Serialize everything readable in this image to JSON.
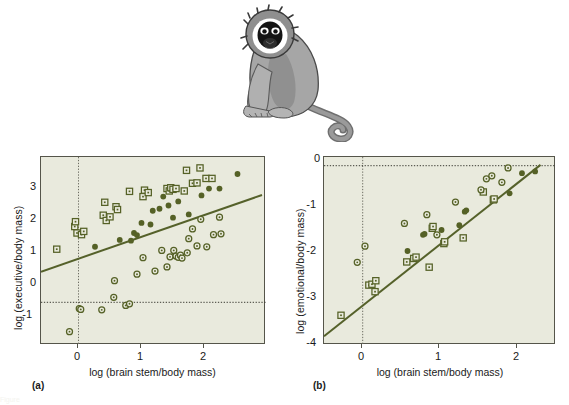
{
  "figure": {
    "illustration": "vervet-monkey-sitting",
    "caption_partial": "Figure"
  },
  "panels": [
    {
      "key": "(a)",
      "xlabel": "log (brain stem/body mass)",
      "ylabel": "log (executive/body mass)",
      "chart_data": {
        "type": "scatter",
        "title": "",
        "xlabel": "log (brain stem/body mass)",
        "ylabel": "log (executive/body mass)",
        "xlim": [
          -0.5,
          2.5
        ],
        "ylim": [
          -1.15,
          3.5
        ],
        "xticks": [
          0,
          1,
          2
        ],
        "yticks": [
          -1,
          0,
          1,
          2,
          3
        ],
        "grid": false,
        "reference_lines": [
          {
            "orientation": "vertical",
            "value": 0,
            "style": "dotted"
          },
          {
            "orientation": "horizontal",
            "value": 0,
            "style": "dotted"
          }
        ],
        "fit_line": {
          "x": [
            -0.5,
            2.45
          ],
          "y": [
            0.68,
            2.58
          ],
          "style": "solid"
        },
        "legend_position": "none",
        "series": [
          {
            "name": "open-square",
            "marker": "open-square",
            "points": [
              [
                -0.29,
                1.22
              ],
              [
                -0.05,
                1.78
              ],
              [
                -0.04,
                1.9
              ],
              [
                -0.02,
                1.62
              ],
              [
                0.04,
                1.58
              ],
              [
                0.07,
                1.66
              ],
              [
                0.33,
                2.06
              ],
              [
                0.35,
                2.38
              ],
              [
                0.37,
                1.93
              ],
              [
                0.42,
                2.02
              ],
              [
                0.5,
                2.27
              ],
              [
                0.52,
                2.2
              ],
              [
                0.68,
                2.65
              ],
              [
                0.86,
                2.52
              ],
              [
                0.88,
                2.68
              ],
              [
                0.93,
                2.62
              ],
              [
                1.18,
                2.72
              ],
              [
                1.21,
                2.66
              ],
              [
                1.23,
                2.74
              ],
              [
                1.26,
                2.7
              ],
              [
                1.3,
                2.72
              ],
              [
                1.41,
                2.66
              ],
              [
                1.44,
                3.17
              ],
              [
                1.52,
                2.85
              ],
              [
                1.58,
                2.86
              ],
              [
                1.62,
                3.23
              ],
              [
                1.7,
                2.97
              ],
              [
                1.78,
                2.97
              ]
            ]
          },
          {
            "name": "filled-circle",
            "marker": "filled-circle",
            "points": [
              [
                0.22,
                1.28
              ],
              [
                0.55,
                1.45
              ],
              [
                0.7,
                1.43
              ],
              [
                0.74,
                1.62
              ],
              [
                0.78,
                1.57
              ],
              [
                0.84,
                1.87
              ],
              [
                0.96,
                1.83
              ],
              [
                0.99,
                2.17
              ],
              [
                1.08,
                2.22
              ],
              [
                1.13,
                2.52
              ],
              [
                1.2,
                2.3
              ],
              [
                1.26,
                2.0
              ],
              [
                1.33,
                2.4
              ],
              [
                1.47,
                2.08
              ],
              [
                1.64,
                2.55
              ],
              [
                1.74,
                2.72
              ],
              [
                1.88,
                2.72
              ],
              [
                2.12,
                3.08
              ]
            ]
          },
          {
            "name": "open-circle",
            "marker": "open-circle",
            "points": [
              [
                -0.12,
                -0.82
              ],
              [
                0.01,
                -0.25
              ],
              [
                0.03,
                -0.27
              ],
              [
                0.31,
                -0.28
              ],
              [
                0.47,
                0.03
              ],
              [
                0.48,
                0.44
              ],
              [
                0.63,
                -0.17
              ],
              [
                0.68,
                -0.13
              ],
              [
                0.78,
                0.6
              ],
              [
                0.86,
                1.01
              ],
              [
                1.02,
                0.68
              ],
              [
                1.11,
                1.19
              ],
              [
                1.18,
                0.78
              ],
              [
                1.22,
                1.03
              ],
              [
                1.27,
                1.19
              ],
              [
                1.3,
                1.05
              ],
              [
                1.33,
                1.02
              ],
              [
                1.36,
                1.07
              ],
              [
                1.38,
                1.0
              ],
              [
                1.45,
                1.13
              ],
              [
                1.47,
                1.48
              ],
              [
                1.52,
                1.72
              ],
              [
                1.58,
                1.3
              ],
              [
                1.63,
                1.96
              ],
              [
                1.71,
                1.28
              ],
              [
                1.8,
                1.58
              ],
              [
                1.88,
                2.01
              ],
              [
                1.9,
                1.6
              ]
            ]
          }
        ]
      }
    },
    {
      "key": "(b)",
      "xlabel": "log (brain stem/body mass)",
      "ylabel": "log (emotional/body mass)",
      "chart_data": {
        "type": "scatter",
        "title": "",
        "xlabel": "log (brain stem/body mass)",
        "ylabel": "log (emotional/body mass)",
        "xlim": [
          -0.5,
          2.5
        ],
        "ylim": [
          -4.1,
          0.2
        ],
        "xticks": [
          0,
          1,
          2
        ],
        "yticks": [
          -4,
          -3,
          -2,
          -1,
          0
        ],
        "grid": false,
        "reference_lines": [
          {
            "orientation": "vertical",
            "value": 0,
            "style": "dotted"
          },
          {
            "orientation": "horizontal",
            "value": 0,
            "style": "dotted"
          }
        ],
        "fit_line": {
          "x": [
            -0.5,
            2.3
          ],
          "y": [
            -3.23,
            0.02
          ],
          "style": "solid"
        },
        "legend_position": "none",
        "series": [
          {
            "name": "open-square",
            "marker": "open-square",
            "points": [
              [
                -0.28,
                -3.42
              ],
              [
                0.08,
                -2.73
              ],
              [
                0.12,
                -2.71
              ],
              [
                0.17,
                -2.63
              ],
              [
                0.16,
                -2.88
              ],
              [
                0.57,
                -2.2
              ],
              [
                0.66,
                -2.12
              ],
              [
                0.69,
                -2.09
              ],
              [
                0.86,
                -2.32
              ],
              [
                0.9,
                -1.43
              ],
              [
                0.91,
                -1.39
              ],
              [
                1.05,
                -1.78
              ],
              [
                1.06,
                -1.74
              ],
              [
                1.3,
                -1.65
              ],
              [
                1.56,
                -0.6
              ],
              [
                1.69,
                -0.78
              ],
              [
                1.7,
                -0.76
              ]
            ]
          },
          {
            "name": "filled-circle",
            "marker": "filled-circle",
            "points": [
              [
                0.58,
                -1.95
              ],
              [
                0.78,
                -1.58
              ],
              [
                0.8,
                -1.56
              ],
              [
                1.02,
                -1.47
              ],
              [
                1.25,
                -1.36
              ],
              [
                1.32,
                -1.05
              ],
              [
                1.34,
                -1.02
              ],
              [
                1.9,
                -0.63
              ],
              [
                2.06,
                -0.17
              ],
              [
                2.23,
                -0.13
              ]
            ]
          },
          {
            "name": "open-circle",
            "marker": "open-circle",
            "points": [
              [
                -0.07,
                -2.21
              ],
              [
                0.03,
                -1.84
              ],
              [
                0.54,
                -1.32
              ],
              [
                0.83,
                -1.12
              ],
              [
                0.96,
                -1.58
              ],
              [
                1.2,
                -0.83
              ],
              [
                1.53,
                -0.55
              ],
              [
                1.6,
                -0.3
              ],
              [
                1.67,
                -0.23
              ],
              [
                1.8,
                -0.38
              ],
              [
                1.88,
                -0.05
              ]
            ]
          }
        ]
      }
    }
  ],
  "colors": {
    "plot_background": "#e9eadd",
    "frame": "#55554a",
    "marker_green": "#556126",
    "fit_line": "#55612a",
    "page_background": "#ffffff",
    "text": "#1a1a1a"
  }
}
